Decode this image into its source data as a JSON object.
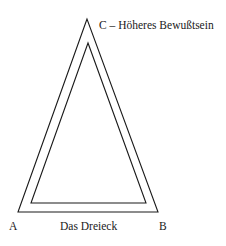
{
  "diagram": {
    "title": "Das Dreieck",
    "vertices": {
      "A": {
        "label": "A"
      },
      "B": {
        "label": "B"
      },
      "C": {
        "label": "C – Höheres Bewußtsein"
      }
    },
    "colors": {
      "line": "#1a1a1a",
      "background": "#ffffff"
    }
  }
}
